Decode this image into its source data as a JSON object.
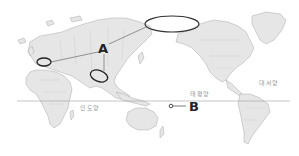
{
  "map": {
    "projection": "pacific-centered world map",
    "background_color": "#ffffff",
    "land_color": "#e6e6e6",
    "coast_color": "#a8a8a8",
    "annotation_color": "#222222",
    "equator_line_color": "#9e9e9e"
  },
  "markers": [
    {
      "id": "A",
      "label": "A",
      "type": "callout",
      "x": 103,
      "y": 47,
      "points_to": [
        "europe-ellipse",
        "central-asia-ellipse",
        "arctic-ellipse"
      ]
    },
    {
      "id": "B",
      "label": "B",
      "type": "point",
      "x": 171,
      "y": 106,
      "description": "point in Pacific near equator"
    }
  ],
  "regions": [
    {
      "id": "europe-ellipse",
      "cx": 44,
      "cy": 62,
      "rx": 7,
      "ry": 4
    },
    {
      "id": "central-asia-ellipse",
      "cx": 99,
      "cy": 76,
      "rx": 9,
      "ry": 6
    },
    {
      "id": "arctic-ellipse",
      "cx": 172,
      "cy": 24,
      "rx": 27,
      "ry": 8
    }
  ],
  "ocean_labels": [
    {
      "id": "indian-ocean",
      "text": "인도양",
      "x": 88,
      "y": 108
    },
    {
      "id": "pacific-ocean",
      "text": "태평양",
      "x": 200,
      "y": 94
    },
    {
      "id": "atlantic-ocean",
      "text": "대서양",
      "x": 265,
      "y": 84
    }
  ],
  "equator": {
    "y": 101,
    "x1": 17,
    "x2": 290
  }
}
